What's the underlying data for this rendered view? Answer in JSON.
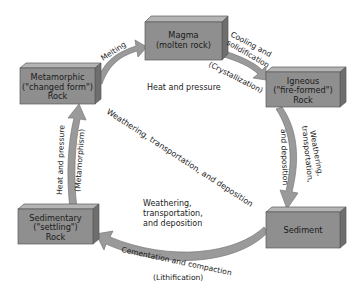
{
  "diagram": {
    "colors": {
      "box_front": "#8f8f8f",
      "box_top": "#b4b4b4",
      "box_side": "#6e6e6e",
      "box_border": "#5a5a5a",
      "arrow_fill": "#9a9a9a",
      "arrow_stroke": "#7a7a7a",
      "text": "#1a1a1a",
      "background": "#ffffff"
    },
    "nodes": {
      "magma": {
        "line1": "Magma",
        "line2": "(molten rock)"
      },
      "igneous": {
        "line1": "Igneous",
        "line2": "(\"fire-formed\")",
        "line3": "Rock"
      },
      "sediment": {
        "line1": "Sediment"
      },
      "sedimentary": {
        "line1": "Sedimentary",
        "line2": "(\"settling\")",
        "line3": "Rock"
      },
      "metamorphic": {
        "line1": "Metamorphic",
        "line2": "(\"changed form\")",
        "line3": "Rock"
      }
    },
    "edges": {
      "melting": {
        "label": "Melting"
      },
      "cooling": {
        "label1": "Cooling and",
        "label2": "solidification",
        "label3": "(Crystallization)"
      },
      "igneous_to_sediment": {
        "label1": "Weathering,",
        "label2": "transportation,",
        "label3": "and deposition"
      },
      "lithification": {
        "label1": "Cementation and compaction",
        "label2": "(Lithification)"
      },
      "metamorphism": {
        "label1": "Heat and pressure",
        "label2": "(Metamorphism)"
      }
    },
    "inner_labels": {
      "heat_pressure": "Heat and pressure",
      "diagonal": "Weathering, transportation, and deposition",
      "inner_block1": "Weathering,",
      "inner_block2": "transportation,",
      "inner_block3": "and deposition"
    }
  }
}
